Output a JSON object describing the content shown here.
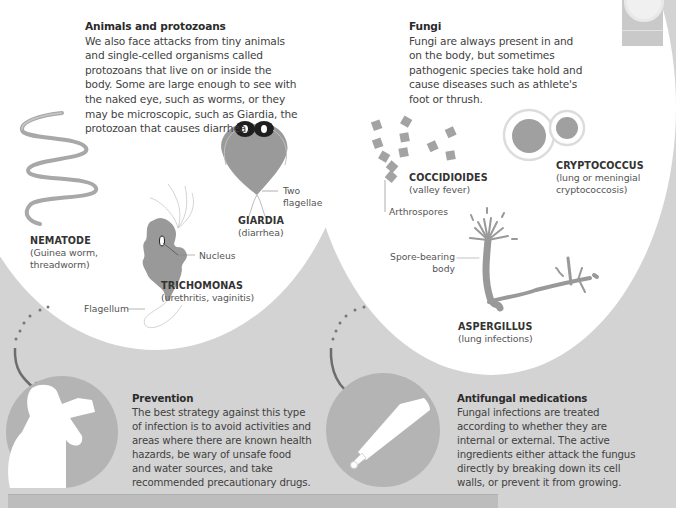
{
  "animals": {
    "title": "Animals and protozoans",
    "body_lines": [
      "We also face attacks from tiny animals",
      "and single-celled organisms called",
      "protozoans that live on or inside the",
      "body. Some are large enough to see with",
      "the naked eye, such as worms, or they",
      "may be microscopic, such as Giardia, the",
      "protozoan that causes diarrhea."
    ],
    "nematode": {
      "name": "NEMATODE",
      "desc_lines": [
        "(Guinea worm,",
        "threadworm)"
      ]
    },
    "giardia": {
      "name": "GIARDIA",
      "desc": "(diarrhea)",
      "callout_lines": [
        "Two",
        "flagellae"
      ]
    },
    "trichomonas": {
      "name": "TRICHOMONAS",
      "desc": "(urethritis, vaginitis)",
      "callout_nucleus": "Nucleus",
      "callout_flagellum": "Flagellum"
    }
  },
  "fungi": {
    "title": "Fungi",
    "body_lines": [
      "Fungi are always present in and",
      "on the body, but sometimes",
      "pathogenic species take hold and",
      "cause diseases such as athlete's",
      "foot or thrush."
    ],
    "coccidioides": {
      "name": "COCCIDIOIDES",
      "desc": "(valley fever)",
      "callout": "Arthrospores"
    },
    "cryptococcus": {
      "name": "CRYPTOCOCCUS",
      "desc_lines": [
        "(lung or meningial",
        "cryptococcosis)"
      ]
    },
    "aspergillus": {
      "name": "ASPERGILLUS",
      "desc": "(lung infections)",
      "callout_lines": [
        "Spore-bearing",
        "body"
      ]
    }
  },
  "prevention": {
    "title": "Prevention",
    "body_lines": [
      "The best strategy against this type",
      "of infection is to avoid activities and",
      "areas where there are known health",
      "hazards, be wary of unsafe food",
      "and water sources, and take",
      "recommended precautionary drugs."
    ],
    "icon": "person-drinking-icon"
  },
  "antifungal": {
    "title": "Antifungal medications",
    "body_lines": [
      "Fungal infections are treated",
      "according to whether they are",
      "internal or external. The active",
      "ingredients either attack the fungus",
      "directly by breaking down its cell",
      "walls, or prevent it from growing."
    ],
    "icon": "ointment-tube-icon"
  },
  "colors": {
    "background": "#d3d3d3",
    "circle": "#ffffff",
    "organism": "#9a9a9a",
    "icon_circle": "#b4b4b4",
    "arrow": "#6d6d6d"
  }
}
